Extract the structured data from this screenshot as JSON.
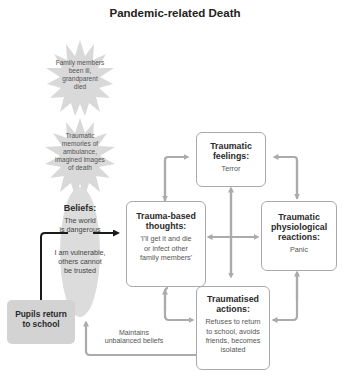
{
  "title": "Pandemic-related Death",
  "bursts": [
    {
      "text_lines": [
        "Family members",
        "been ill,",
        "grandparent",
        "died"
      ]
    },
    {
      "text_lines": [
        "Traumatic",
        "memories of",
        "ambulance,",
        "imagined images",
        "of death"
      ]
    }
  ],
  "beliefs": {
    "heading": "Beliefs:",
    "line1": "The world",
    "line2": "is dangerous",
    "line3": "I am vulnerable,",
    "line4": "others cannot",
    "line5": "be trusted"
  },
  "pupils": {
    "line1": "Pupils return",
    "line2": "to school"
  },
  "boxes": {
    "feelings": {
      "h1": "Traumatic",
      "h2": "feelings:",
      "body": "Terror"
    },
    "thoughts": {
      "h1": "Trauma-based",
      "h2": "thoughts:",
      "b1": "'I'll get it and die",
      "b2": "or infect other",
      "b3": "family members'"
    },
    "physiological": {
      "h1": "Traumatic",
      "h2": "physiological",
      "h3": "reactions:",
      "body": "Panic"
    },
    "actions": {
      "h1": "Traumatised",
      "h2": "actions:",
      "b1": "Refuses to return",
      "b2": "to school, avoids",
      "b3": "friends, becomes",
      "b4": "isolated"
    }
  },
  "loop_label": {
    "line1": "Maintains",
    "line2": "unbalanced beliefs"
  },
  "colors": {
    "arrow": "#ababab",
    "burst": "#d9d9d9",
    "pupils_box": "#d3d3d3",
    "box_border": "#a9a9a9",
    "black_arrow": "#1a1a1a"
  }
}
